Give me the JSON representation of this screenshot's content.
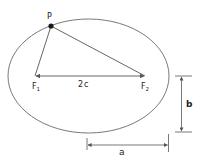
{
  "diagram": {
    "colors": {
      "stroke": "#555555",
      "text": "#222222",
      "point": "#1a1a1a"
    },
    "ellipse": {
      "cx": 88.5,
      "cy": 76,
      "rx": 80.5,
      "ry": 57
    },
    "point_p": {
      "label": "P",
      "x": 51,
      "y": 26
    },
    "focus_1": {
      "label": "F",
      "subscript": "1",
      "x": 35,
      "y": 76
    },
    "focus_2": {
      "label": "F",
      "subscript": "2",
      "x": 145,
      "y": 76
    },
    "focal_distance": {
      "label": "2c"
    },
    "semi_minor": {
      "label": "b",
      "x": 181,
      "y1": 76,
      "y2": 132
    },
    "semi_major": {
      "label": "a",
      "y": 145,
      "x1": 87,
      "x2": 168
    }
  }
}
